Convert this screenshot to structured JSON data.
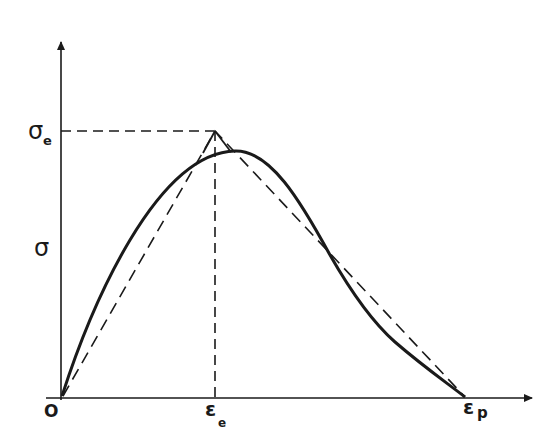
{
  "diagram": {
    "title": "",
    "labels": {
      "y_axis": "σ",
      "sigma_e": "σ",
      "sigma_e_sub": "e",
      "origin": "O",
      "eps_e": "ε",
      "eps_e_sub": "e",
      "eps_p": "ε",
      "eps_p_sub": "p"
    },
    "colors": {
      "ink": "#1a1a1a",
      "background": "#ffffff"
    },
    "elements": [
      "y-axis with arrow",
      "x-axis with arrow",
      "solid curve: actual stress-strain curve peaking near (εe, σe)",
      "dashed bilinear (triangular) approximation: O → (εe, σe) → εp",
      "dashed horizontal guide at σe",
      "dashed vertical guide at εe"
    ]
  }
}
